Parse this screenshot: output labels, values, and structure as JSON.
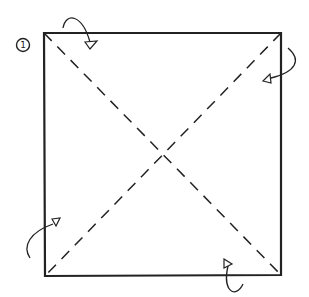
{
  "diagram": {
    "type": "origami-fold-step",
    "step": {
      "number": "1",
      "label_style": "circled-numeral"
    },
    "paper": {
      "shape": "square",
      "corners": {
        "top_left": [
          44,
          33
        ],
        "top_right": [
          281,
          33
        ],
        "bottom_right": [
          281,
          275
        ],
        "bottom_left": [
          45,
          276
        ]
      },
      "stroke_color": "#222222"
    },
    "folds": [
      {
        "name": "diagonal-valley-fold-tl-br",
        "line_style": "dashed",
        "from": "top_left",
        "to": "bottom_right"
      },
      {
        "name": "diagonal-valley-fold-tr-bl",
        "line_style": "dashed",
        "from": "top_right",
        "to": "bottom_left"
      }
    ],
    "arrows": [
      {
        "name": "fold-arrow-top-left",
        "direction": "down-right",
        "path": "M63,28 C66,12 82,14 90,44",
        "head": [
          90,
          46
        ]
      },
      {
        "name": "fold-arrow-top-right",
        "direction": "down-left",
        "path": "M288,48 C302,60 294,74 268,79",
        "head": [
          266,
          80
        ]
      },
      {
        "name": "fold-arrow-bottom-left",
        "direction": "up-right",
        "path": "M30,258 C22,246 32,230 55,223",
        "head": [
          57,
          222
        ]
      },
      {
        "name": "fold-arrow-bottom-right",
        "direction": "up-left",
        "path": "M243,284 C236,298 222,292 227,263",
        "head": [
          226,
          261
        ]
      }
    ]
  }
}
